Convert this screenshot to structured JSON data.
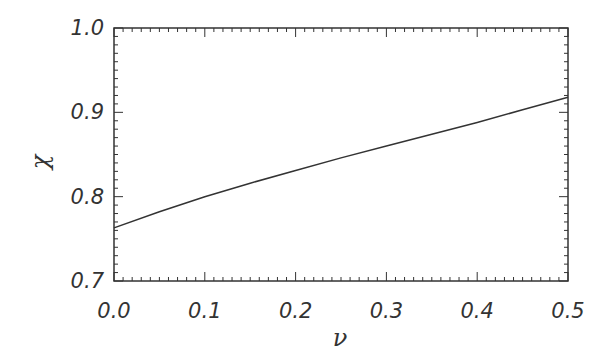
{
  "chart_data": {
    "type": "line",
    "title": "",
    "xlabel": "ν",
    "ylabel": "χ",
    "xlim": [
      0.0,
      0.5
    ],
    "ylim": [
      0.7,
      1.0
    ],
    "grid": false,
    "legend": null,
    "x_ticks": [
      "0.0",
      "0.1",
      "0.2",
      "0.3",
      "0.4",
      "0.5"
    ],
    "y_ticks": [
      "0.7",
      "0.8",
      "0.9",
      "1.0"
    ],
    "series": [
      {
        "name": "chi(nu)",
        "color": "#333333",
        "x": [
          0.0,
          0.05,
          0.1,
          0.15,
          0.2,
          0.25,
          0.3,
          0.35,
          0.4,
          0.45,
          0.5
        ],
        "y": [
          0.763,
          0.782,
          0.8,
          0.816,
          0.831,
          0.846,
          0.86,
          0.874,
          0.888,
          0.903,
          0.918
        ]
      }
    ]
  }
}
